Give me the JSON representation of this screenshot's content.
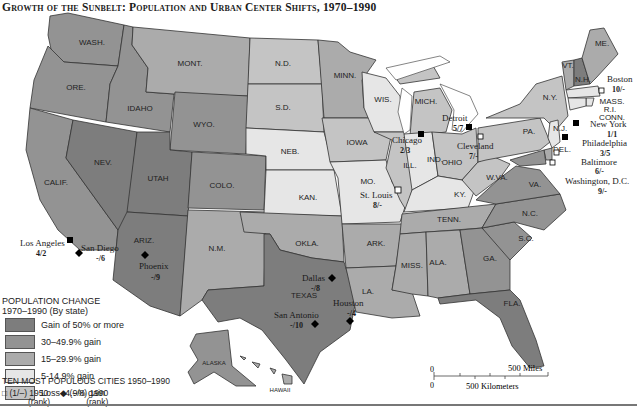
{
  "title": "Growth of the Sunbelt: Population and Urban Center Shifts, 1970–1990",
  "legend": {
    "heading_line1": "POPULATION CHANGE",
    "heading_line2": "1970–1990 (By state)",
    "categories": [
      {
        "label": "Gain of 50% or more",
        "color": "#7d7d7d"
      },
      {
        "label": "30–49.9% gain",
        "color": "#939393"
      },
      {
        "label": "15–29.9% gain",
        "color": "#ababab"
      },
      {
        "label": "5-14.9% gain",
        "color": "#e6e6e6"
      },
      {
        "label": "Loss–4.9% gain",
        "color": "#c4c4c4"
      }
    ]
  },
  "cities_legend": {
    "heading": "TEN MOST POPULOUS CITIES 1950–1990",
    "square_label": "(1/–) 1950",
    "square_sub": "(rank)",
    "diamond_label": "(–/8) 1990",
    "diamond_sub": "(rank)"
  },
  "scale": {
    "miles_label": "500 Miles",
    "km_label": "500 Kilometers",
    "zero": "0"
  },
  "states": [
    {
      "abbr": "WASH.",
      "cat": 1
    },
    {
      "abbr": "ORE.",
      "cat": 1
    },
    {
      "abbr": "CALIF.",
      "cat": 1
    },
    {
      "abbr": "IDAHO",
      "cat": 1
    },
    {
      "abbr": "NEV.",
      "cat": 0
    },
    {
      "abbr": "MONT.",
      "cat": 2
    },
    {
      "abbr": "WYO.",
      "cat": 1
    },
    {
      "abbr": "UTAH",
      "cat": 0
    },
    {
      "abbr": "COLO.",
      "cat": 1
    },
    {
      "abbr": "ARIZ.",
      "cat": 0
    },
    {
      "abbr": "N.M.",
      "cat": 2
    },
    {
      "abbr": "N.D.",
      "cat": 4
    },
    {
      "abbr": "S.D.",
      "cat": 4
    },
    {
      "abbr": "NEB.",
      "cat": 3
    },
    {
      "abbr": "KAN.",
      "cat": 3
    },
    {
      "abbr": "OKLA.",
      "cat": 2
    },
    {
      "abbr": "TEXAS",
      "cat": 0
    },
    {
      "abbr": "MINN.",
      "cat": 2
    },
    {
      "abbr": "IOWA",
      "cat": 4
    },
    {
      "abbr": "MO.",
      "cat": 3
    },
    {
      "abbr": "ARK.",
      "cat": 2
    },
    {
      "abbr": "LA.",
      "cat": 2
    },
    {
      "abbr": "WIS.",
      "cat": 3
    },
    {
      "abbr": "ILL.",
      "cat": 4
    },
    {
      "abbr": "MICH.",
      "cat": 4
    },
    {
      "abbr": "IND.",
      "cat": 3
    },
    {
      "abbr": "OHIO",
      "cat": 4
    },
    {
      "abbr": "KY.",
      "cat": 3
    },
    {
      "abbr": "TENN.",
      "cat": 2
    },
    {
      "abbr": "MISS.",
      "cat": 2
    },
    {
      "abbr": "ALA.",
      "cat": 2
    },
    {
      "abbr": "GA.",
      "cat": 1
    },
    {
      "abbr": "FLA.",
      "cat": 0
    },
    {
      "abbr": "S.C.",
      "cat": 1
    },
    {
      "abbr": "N.C.",
      "cat": 1
    },
    {
      "abbr": "VA.",
      "cat": 1
    },
    {
      "abbr": "W.VA.",
      "cat": 4
    },
    {
      "abbr": "PA.",
      "cat": 4
    },
    {
      "abbr": "N.Y.",
      "cat": 4
    },
    {
      "abbr": "VT.",
      "cat": 2
    },
    {
      "abbr": "N.H.",
      "cat": 0
    },
    {
      "abbr": "ME.",
      "cat": 2
    },
    {
      "abbr": "MASS.",
      "cat": 3
    },
    {
      "abbr": "R.I.",
      "cat": 3
    },
    {
      "abbr": "CONN.",
      "cat": 3
    },
    {
      "abbr": "N.J.",
      "cat": 3
    },
    {
      "abbr": "DEL.",
      "cat": 2
    },
    {
      "abbr": "ALASKA",
      "cat": 1
    },
    {
      "abbr": "HAWAII",
      "cat": 2
    }
  ],
  "cities": [
    {
      "name": "Los Angeles",
      "rank": "4/2",
      "marker": "square"
    },
    {
      "name": "San Diego",
      "rank": "-/6",
      "marker": "diamond"
    },
    {
      "name": "Phoenix",
      "rank": "-/9",
      "marker": "diamond"
    },
    {
      "name": "Dallas",
      "rank": "-/8",
      "marker": "diamond"
    },
    {
      "name": "San Antonio",
      "rank": "-/10",
      "marker": "diamond"
    },
    {
      "name": "Houston",
      "rank": "-/4",
      "marker": "diamond"
    },
    {
      "name": "Chicago",
      "rank": "2/3",
      "marker": "square"
    },
    {
      "name": "St. Louis",
      "rank": "8/-",
      "marker": "open-square"
    },
    {
      "name": "Detroit",
      "rank": "5/7",
      "marker": "square"
    },
    {
      "name": "Cleveland",
      "rank": "7/-",
      "marker": "open-square"
    },
    {
      "name": "Boston",
      "rank": "10/-",
      "marker": "open-square"
    },
    {
      "name": "New York",
      "rank": "1/1",
      "marker": "square"
    },
    {
      "name": "Philadelphia",
      "rank": "3/5",
      "marker": "square"
    },
    {
      "name": "Baltimore",
      "rank": "6/-",
      "marker": "open-square"
    },
    {
      "name": "Washington, D.C.",
      "rank": "9/-",
      "marker": "open-square"
    }
  ]
}
